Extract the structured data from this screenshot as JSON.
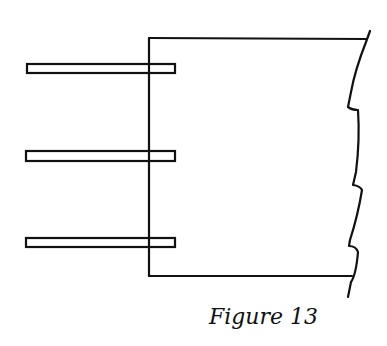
{
  "figure": {
    "caption": "Figure 13",
    "stroke_color": "#111111",
    "background": "#ffffff",
    "elements": {
      "frame": "rectangle open on right with broken (zigzag) edge",
      "plates": [
        {
          "label": "top-plate"
        },
        {
          "label": "middle-plate"
        },
        {
          "label": "bottom-plate"
        }
      ]
    }
  }
}
